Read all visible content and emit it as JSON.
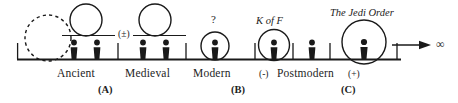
{
  "diagram": {
    "axis": {
      "arrow_end_symbol": "∞",
      "baseline_color": "#1a1a1a"
    },
    "eras": [
      {
        "key": "ancient",
        "label": "Ancient"
      },
      {
        "key": "medieval",
        "label": "Medieval"
      },
      {
        "key": "modern",
        "label": "Modern"
      },
      {
        "key": "postmodern",
        "label": "Postmodern"
      }
    ],
    "era_signs": {
      "ancient_medieval_boundary": "(±)",
      "postmodern_left": "(-)",
      "postmodern_right": "(+)"
    },
    "group_markers": [
      {
        "key": "a",
        "label": "(A)"
      },
      {
        "key": "b",
        "label": "(B)"
      },
      {
        "key": "c",
        "label": "(C)"
      }
    ],
    "annotations": [
      {
        "key": "unknown-modern",
        "label": "?",
        "style": "plain"
      },
      {
        "key": "k-of-f",
        "label": "K of F",
        "style": "italic"
      },
      {
        "key": "jedi-order",
        "label": "The Jedi Order",
        "style": "italic"
      }
    ],
    "figures_count": {
      "ancient": 2,
      "medieval": 2,
      "modern_unknown": 1,
      "modern_kof": 1,
      "postmodern_minus": 1,
      "postmodern_jedi": 1
    },
    "circles": [
      {
        "key": "prehistory-dashed",
        "dashed": true,
        "encloses_figure": false
      },
      {
        "key": "ancient-open",
        "dashed": false,
        "encloses_figure": false
      },
      {
        "key": "medieval-open",
        "dashed": false,
        "encloses_figure": false
      },
      {
        "key": "modern-unknown",
        "dashed": false,
        "encloses_figure": true
      },
      {
        "key": "modern-kof",
        "dashed": false,
        "encloses_figure": true
      },
      {
        "key": "postmodern-jedi",
        "dashed": false,
        "encloses_figure": true
      }
    ]
  }
}
